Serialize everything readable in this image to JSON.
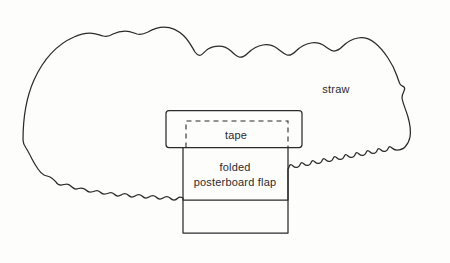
{
  "figure": {
    "background_color": "#fdfdfc",
    "stroke_color": "#2b2b2b"
  },
  "labels": {
    "straw": "straw",
    "tape": "tape",
    "flap_line1": "folded",
    "flap_line2": "posterboard flap"
  },
  "shapes": {
    "straw_outline": "straw-bale-outline",
    "tape_rect": "tape-rectangle",
    "tape_dashed_rect": "tape-dashed-rectangle",
    "flap_rect": "posterboard-flap-rectangle"
  }
}
